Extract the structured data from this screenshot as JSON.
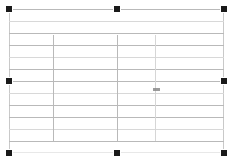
{
  "canvas": {
    "width": 234,
    "height": 162,
    "background": "#ffffff"
  },
  "selection": {
    "object_type": "table",
    "state_label": "selected",
    "handle_color": "#1a1a1a",
    "handle_border_color": "#ffffff",
    "handle_size": 6,
    "handles": [
      {
        "name": "handle-top-left",
        "position": "top-left",
        "x": 9,
        "y": 9
      },
      {
        "name": "handle-top-center",
        "position": "top-center",
        "x": 117,
        "y": 9
      },
      {
        "name": "handle-top-right",
        "position": "top-right",
        "x": 224,
        "y": 9
      },
      {
        "name": "handle-middle-left",
        "position": "middle-left",
        "x": 9,
        "y": 81
      },
      {
        "name": "handle-middle-right",
        "position": "middle-right",
        "x": 224,
        "y": 81
      },
      {
        "name": "handle-bottom-left",
        "position": "bottom-left",
        "x": 9,
        "y": 153
      },
      {
        "name": "handle-bottom-center",
        "position": "bottom-center",
        "x": 117,
        "y": 153
      },
      {
        "name": "handle-bottom-right",
        "position": "bottom-right",
        "x": 224,
        "y": 153
      }
    ]
  },
  "table": {
    "x": 9,
    "y": 9,
    "width": 215,
    "height": 144,
    "border_color": "#c9c9c9",
    "rule_color": "#b9b9b9",
    "faint_rule_color": "#d8d8d8",
    "row_count": 12,
    "column_count": 4,
    "rows": [
      {
        "index": 0,
        "top": 0,
        "height": 12,
        "rule_weight": "solid"
      },
      {
        "index": 1,
        "top": 12,
        "height": 12,
        "rule_weight": "faint"
      },
      {
        "index": 2,
        "top": 24,
        "height": 12,
        "rule_weight": "solid"
      },
      {
        "index": 3,
        "top": 36,
        "height": 12,
        "rule_weight": "solid"
      },
      {
        "index": 4,
        "top": 48,
        "height": 12,
        "rule_weight": "faint"
      },
      {
        "index": 5,
        "top": 60,
        "height": 12,
        "rule_weight": "solid"
      },
      {
        "index": 6,
        "top": 72,
        "height": 12,
        "rule_weight": "solid"
      },
      {
        "index": 7,
        "top": 84,
        "height": 12,
        "rule_weight": "faint"
      },
      {
        "index": 8,
        "top": 96,
        "height": 12,
        "rule_weight": "solid"
      },
      {
        "index": 9,
        "top": 108,
        "height": 12,
        "rule_weight": "solid"
      },
      {
        "index": 10,
        "top": 120,
        "height": 12,
        "rule_weight": "faint"
      },
      {
        "index": 11,
        "top": 132,
        "height": 12,
        "rule_weight": "solid"
      }
    ],
    "column_dividers": [
      {
        "index": 0,
        "x": 44,
        "top": 26,
        "bottom": 132,
        "weight": "solid"
      },
      {
        "index": 1,
        "x": 108,
        "top": 26,
        "bottom": 132,
        "weight": "solid"
      },
      {
        "index": 2,
        "x": 146,
        "top": 26,
        "bottom": 132,
        "weight": "faint"
      }
    ],
    "caret": {
      "label": "text-caret",
      "x": 144,
      "y": 79,
      "color": "#8a8a8a"
    }
  }
}
